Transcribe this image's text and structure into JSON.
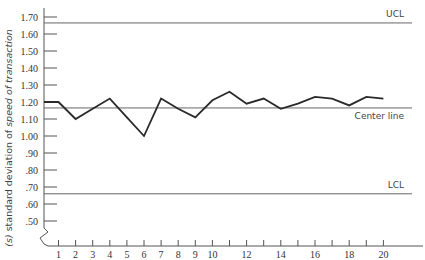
{
  "chart_data": {
    "type": "line",
    "title": "",
    "xlabel": "",
    "ylabel": "(s) standard deviation of speed of transaction",
    "ylabel_parts": {
      "prefix": "(s)",
      "middle": " standard deviation of ",
      "suffix": "speed of transaction"
    },
    "x": [
      1,
      2,
      3,
      4,
      5,
      6,
      7,
      8,
      9,
      10,
      11,
      12,
      13,
      14,
      15,
      16,
      17,
      18,
      19,
      20
    ],
    "x_tick_labels": [
      {
        "x": 1,
        "label": "1"
      },
      {
        "x": 2,
        "label": "2"
      },
      {
        "x": 3,
        "label": "3"
      },
      {
        "x": 4,
        "label": "4"
      },
      {
        "x": 5,
        "label": "5"
      },
      {
        "x": 6,
        "label": "6"
      },
      {
        "x": 7,
        "label": "7"
      },
      {
        "x": 8,
        "label": "8"
      },
      {
        "x": 9,
        "label": "9"
      },
      {
        "x": 10,
        "label": "10"
      },
      {
        "x": 12,
        "label": "12"
      },
      {
        "x": 14,
        "label": "14"
      },
      {
        "x": 16,
        "label": "16"
      },
      {
        "x": 18,
        "label": "18"
      },
      {
        "x": 20,
        "label": "20"
      }
    ],
    "series": [
      {
        "name": "s",
        "start_value": 1.2,
        "values": [
          1.2,
          1.1,
          1.16,
          1.22,
          1.11,
          1.0,
          1.22,
          1.16,
          1.11,
          1.21,
          1.26,
          1.19,
          1.22,
          1.16,
          1.19,
          1.23,
          1.22,
          1.18,
          1.23,
          1.22
        ]
      }
    ],
    "y_ticks": [
      1.7,
      1.6,
      1.5,
      1.4,
      1.3,
      1.2,
      1.1,
      1.0,
      0.9,
      0.8,
      0.7,
      0.6,
      0.5
    ],
    "y_tick_labels": [
      "1.70",
      "1.60",
      "1.50",
      "1.40",
      "1.30",
      "1.20",
      "1.10",
      "1.00",
      ".90",
      ".80",
      ".70",
      ".60",
      ".50"
    ],
    "ylim": [
      0.5,
      1.75
    ],
    "axis_break": true,
    "reference_lines": [
      {
        "name": "UCL",
        "label": "UCL",
        "value": 1.665
      },
      {
        "name": "Center line",
        "label": "Center line",
        "value": 1.165
      },
      {
        "name": "LCL",
        "label": "LCL",
        "value": 0.66
      }
    ],
    "grid": false,
    "legend": "none",
    "colors": {
      "line": "#2a2a2a",
      "reference": "#666666",
      "axis": "#555555"
    }
  }
}
